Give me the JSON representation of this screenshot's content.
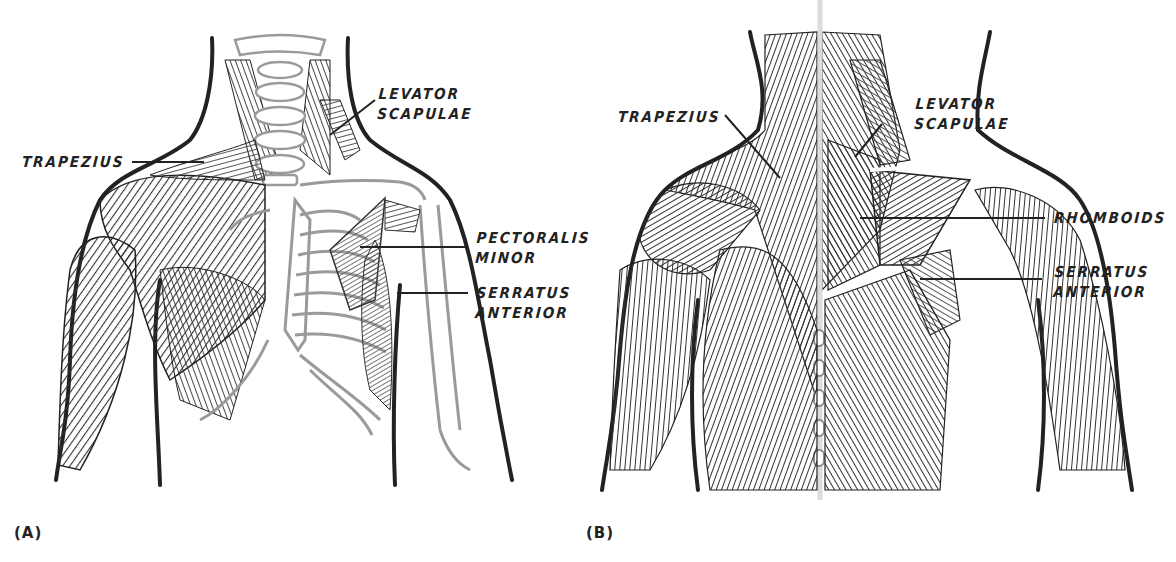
{
  "figure": {
    "background": "#ffffff",
    "ink_color": "#222222",
    "bone_color": "#9a9a9a",
    "panels": [
      {
        "id": "A",
        "tag": "(A)",
        "view": "anterior",
        "labels": [
          {
            "lines": [
              "TRAPEZIUS"
            ]
          },
          {
            "lines": [
              "LEVATOR",
              "SCAPULAE"
            ]
          },
          {
            "lines": [
              "PECTORALIS",
              "MINOR"
            ]
          },
          {
            "lines": [
              "SERRATUS",
              "ANTERIOR"
            ]
          }
        ]
      },
      {
        "id": "B",
        "tag": "(B)",
        "view": "posterior",
        "labels": [
          {
            "lines": [
              "TRAPEZIUS"
            ]
          },
          {
            "lines": [
              "LEVATOR",
              "SCAPULAE"
            ]
          },
          {
            "lines": [
              "RHOMBOIDS"
            ]
          },
          {
            "lines": [
              "SERRATUS",
              "ANTERIOR"
            ]
          }
        ]
      }
    ]
  }
}
